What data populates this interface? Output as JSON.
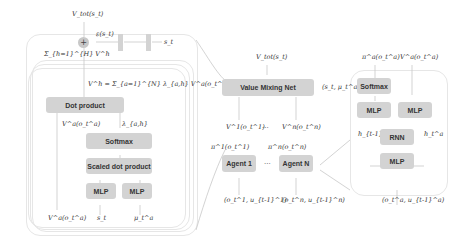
{
  "left_panel": {
    "top_output": "V_tot(s_t)",
    "sum_node": "+",
    "epsilon_label": "ε(s_t)",
    "state_label": "s_t",
    "sum_heads_label": "Σ_{h=1}^{H} V^h",
    "head_formula": "V^h = Σ_{a=1}^{N} λ_{a,h} V^a(o_t^a)",
    "dot_product": "Dot product",
    "va_label": "V^a(o_t^a)",
    "lambda_label": "λ_{a,h}",
    "softmax": "Softmax",
    "scaled_dot_product": "Scaled dot product",
    "mlp_left": "MLP",
    "mlp_right": "MLP",
    "bottom_inputs": [
      "V^a(o_t^a)",
      "s_t",
      "μ_t^a"
    ]
  },
  "middle_panel": {
    "top_output": "V_tot(s_t)",
    "mixing_net": "Value Mixing Net",
    "mixing_input": "(s_t, μ_t^a)",
    "v1_label": "V^1(o_t^1)",
    "vn_label": "V^n(o_t^n)",
    "ellipsis": "...",
    "pi1_label": "π^1(o_t^1)",
    "pin_label": "π^n(o_t^n)",
    "agent1": "Agent 1",
    "agentn": "Agent N",
    "input1": "(o_t^1, u_{t-1}^1)",
    "inputn": "(o_t^n, u_{t-1}^n)"
  },
  "right_panel": {
    "pi_label": "π^a(o_t^a)",
    "v_label": "V^a(o_t^a)",
    "softmax": "Softmax",
    "mlp_left": "MLP",
    "mlp_right": "MLP",
    "h_prev": "h_{t-1}^a",
    "h_next": "h_t^a",
    "rnn": "RNN",
    "mlp_bottom": "MLP",
    "input": "(o_t^a, u_{t-1}^a)"
  }
}
